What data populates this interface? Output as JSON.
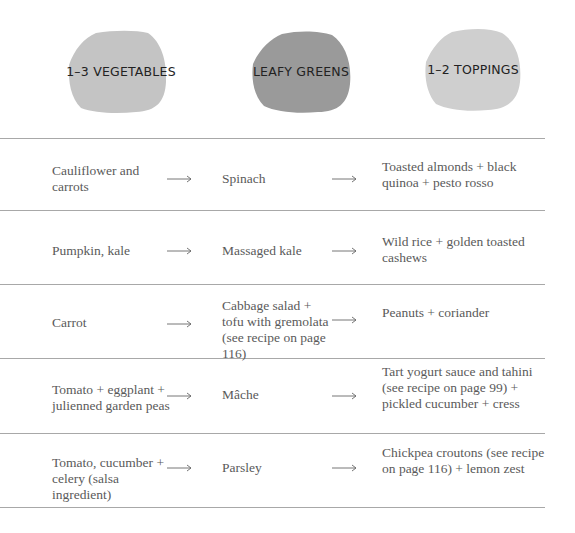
{
  "headers": [
    {
      "label": "1–3 VEGETABLES",
      "color": "#c4c4c4"
    },
    {
      "label": "LEAFY GREENS",
      "color": "#9a9a9a"
    },
    {
      "label": "1–2 TOPPINGS",
      "color": "#cfcfcf"
    }
  ],
  "rows": [
    {
      "vegetables": "Cauliflower and carrots",
      "greens": "Spinach",
      "toppings": "Toasted almonds + black quinoa + pesto rosso"
    },
    {
      "vegetables": "Pumpkin, kale",
      "greens": "Massaged kale",
      "toppings": "Wild rice + golden toasted cashews"
    },
    {
      "vegetables": "Carrot",
      "greens": "Cabbage salad + tofu with gremolata (see recipe on page 116)",
      "toppings": "Peanuts + coriander"
    },
    {
      "vegetables": "Tomato + eggplant + julienned garden peas",
      "greens": "Mâche",
      "toppings": "Tart yogurt sauce and tahini (see recipe on page 99) + pickled cucumber + cress"
    },
    {
      "vegetables": "Tomato, cucumber + celery (salsa ingredient)",
      "greens": "Parsley",
      "toppings": "Chickpea croutons (see recipe on page 116) + lemon zest"
    }
  ],
  "icons": {
    "arrow": "long-right-arrow-icon"
  }
}
